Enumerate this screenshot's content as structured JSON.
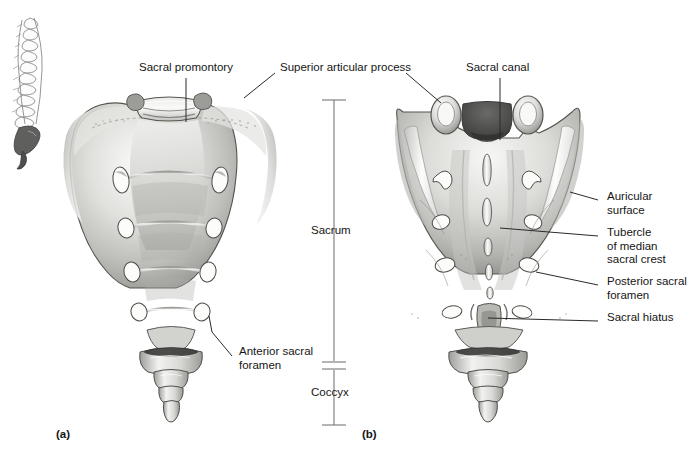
{
  "figure": {
    "type": "anatomical-illustration",
    "panels": [
      {
        "id": "a",
        "label": "(a)",
        "view": "anterior",
        "x": 60,
        "y": 434
      },
      {
        "id": "b",
        "label": "(b)",
        "view": "posterior",
        "x": 366,
        "y": 434
      }
    ],
    "inset": {
      "name": "vertebral-column-lateral-orientation-inset",
      "x": 8,
      "y": 16,
      "w": 48,
      "h": 140
    }
  },
  "bracket": {
    "x": 334,
    "top": 100,
    "bottom": 425,
    "divider": 365,
    "divider_gap": 8,
    "segments": [
      {
        "label": "Sacrum",
        "text_y": 230
      },
      {
        "label": "Coccyx",
        "text_y": 392
      }
    ]
  },
  "labels": [
    {
      "name": "sacral-promontory",
      "text": "Sacral promontory",
      "x": 139,
      "y": 67,
      "align": "left",
      "panel": "a"
    },
    {
      "name": "superior-articular-process",
      "text": "Superior articular process",
      "x": 280,
      "y": 67,
      "align": "left",
      "panel": "both"
    },
    {
      "name": "anterior-sacral-foramen",
      "text": "Anterior sacral\nforamen",
      "x": 239,
      "y": 351,
      "align": "left",
      "panel": "a"
    },
    {
      "name": "sacral-canal",
      "text": "Sacral canal",
      "x": 466,
      "y": 67,
      "align": "left",
      "panel": "b"
    },
    {
      "name": "auricular-surface",
      "text": "Auricular\nsurface",
      "x": 604,
      "y": 195,
      "align": "left",
      "panel": "b"
    },
    {
      "name": "tubercle-of-median-sacral-crest",
      "text": "Tubercle\nof median\nsacral crest",
      "x": 604,
      "y": 231,
      "align": "left",
      "panel": "b"
    },
    {
      "name": "posterior-sacral-foramen",
      "text": "Posterior sacral\nforamen",
      "x": 604,
      "y": 280,
      "align": "left",
      "panel": "b"
    },
    {
      "name": "sacral-hiatus",
      "text": "Sacral hiatus",
      "x": 604,
      "y": 316,
      "align": "left",
      "panel": "b"
    }
  ],
  "colors": {
    "bone_light": "#f2f2f0",
    "bone_mid": "#c9c9c7",
    "bone_dark": "#8f8f8d",
    "bone_shadow": "#5e5e5c",
    "outline": "#4a4a48",
    "text": "#151515",
    "leader": "#2a2a2a",
    "bracket": "#777777",
    "background": "#ffffff"
  },
  "structures": {
    "anterior": {
      "foramina_pairs": 4,
      "transverse_ridges": 4,
      "coccyx_segments": 4
    },
    "posterior": {
      "foramina_pairs": 4,
      "median_crest_tubercles": 4,
      "coccyx_segments": 4,
      "sacral_hiatus": true
    }
  }
}
